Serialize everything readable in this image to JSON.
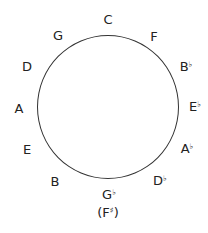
{
  "diagram": {
    "circle": {
      "cx": 108,
      "cy": 107,
      "r": 71,
      "stroke": "#333333"
    },
    "keys": [
      {
        "name": "C",
        "note": "C",
        "accidental": "",
        "x": 108,
        "y": 19
      },
      {
        "name": "F",
        "note": "F",
        "accidental": "",
        "x": 154,
        "y": 36
      },
      {
        "name": "Bb",
        "note": "B",
        "accidental": "♭",
        "x": 185,
        "y": 66
      },
      {
        "name": "Eb",
        "note": "E",
        "accidental": "♭",
        "x": 194,
        "y": 106
      },
      {
        "name": "Ab",
        "note": "A",
        "accidental": "♭",
        "x": 186,
        "y": 148
      },
      {
        "name": "Db",
        "note": "D",
        "accidental": "♭",
        "x": 159,
        "y": 180
      },
      {
        "name": "Gb",
        "note": "G",
        "accidental": "♭",
        "x": 108,
        "y": 194
      },
      {
        "name": "B",
        "note": "B",
        "accidental": "",
        "x": 55,
        "y": 181
      },
      {
        "name": "E",
        "note": "E",
        "accidental": "",
        "x": 27,
        "y": 149
      },
      {
        "name": "A",
        "note": "A",
        "accidental": "",
        "x": 19,
        "y": 108
      },
      {
        "name": "D",
        "note": "D",
        "accidental": "",
        "x": 27,
        "y": 66
      },
      {
        "name": "G",
        "note": "G",
        "accidental": "",
        "x": 58,
        "y": 35
      }
    ],
    "enharmonic": {
      "text_open": "(F",
      "accidental": "♯",
      "text_close": ")",
      "x": 108,
      "y": 212
    }
  }
}
